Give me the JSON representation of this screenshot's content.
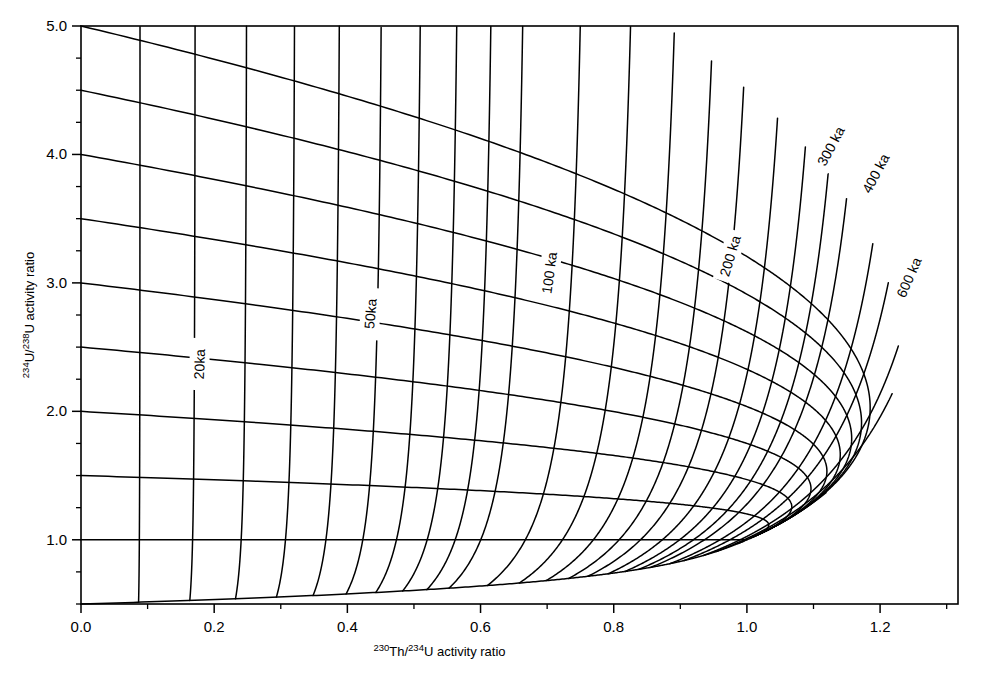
{
  "figure": {
    "name": "u-series-evolution-diagram",
    "background_color": "#ffffff",
    "line_color": "#000000"
  },
  "axes": {
    "x": {
      "label_prefix_sup": "230",
      "label_mid": "Th/",
      "label_prefix_sup2": "234",
      "label_suffix": "U activity  ratio",
      "label_plain": "230Th/234U activity ratio",
      "min": 0.0,
      "max": 1.317,
      "major_ticks": [
        0.0,
        0.2,
        0.4,
        0.6,
        0.8,
        1.0,
        1.2
      ],
      "major_tick_labels": [
        "0.0",
        "0.2",
        "0.4",
        "0.6",
        "0.8",
        "1.0",
        "1.2"
      ],
      "minor_tick_step": 0.1
    },
    "y": {
      "label_prefix_sup": "234",
      "label_mid": "U/",
      "label_prefix_sup2": "238",
      "label_suffix": "U activity ratio",
      "label_plain": "234U/238U activity ratio",
      "min": 0.5,
      "max": 5.0,
      "major_ticks": [
        1.0,
        2.0,
        3.0,
        4.0,
        5.0
      ],
      "major_tick_labels": [
        "1.0",
        "2.0",
        "3.0",
        "4.0",
        "5.0"
      ],
      "minor_tick_step": 0.25
    }
  },
  "chart_data": {
    "type": "line",
    "title": "",
    "xlabel": "230Th/234U activity ratio",
    "ylabel": "234U/238U activity ratio",
    "xlim": [
      0.0,
      1.317
    ],
    "ylim": [
      0.5,
      5.0
    ],
    "grid": false,
    "legend": "none",
    "constants": {
      "lambda230_per_ka": 0.0091705,
      "lambda234_per_ka": 0.0028263
    },
    "isochrons": {
      "name": "constant-age isochrons",
      "unit": "ka",
      "ages_ka": [
        10,
        20,
        30,
        40,
        50,
        60,
        70,
        80,
        90,
        100,
        120,
        140,
        160,
        180,
        200,
        225,
        250,
        275,
        300,
        350,
        400,
        500,
        600,
        1000
      ],
      "labeled_ages": [
        {
          "age_ka": 20,
          "text": "20ka",
          "x_frac": 0.135,
          "y_frac": 0.585,
          "rotate": -88
        },
        {
          "age_ka": 50,
          "text": "50ka",
          "x_frac": 0.33,
          "y_frac": 0.498,
          "rotate": -85
        },
        {
          "age_ka": 100,
          "text": "100 ka",
          "x_frac": 0.534,
          "y_frac": 0.427,
          "rotate": -82
        },
        {
          "age_ka": 200,
          "text": "200 ka",
          "x_frac": 0.74,
          "y_frac": 0.398,
          "rotate": -73
        },
        {
          "age_ka": 300,
          "text": "300 ka",
          "x_frac": 0.855,
          "y_frac": 0.208,
          "rotate": -62
        },
        {
          "age_ka": 400,
          "text": "400 ka",
          "x_frac": 0.906,
          "y_frac": 0.255,
          "rotate": -62
        },
        {
          "age_ka": 600,
          "text": "600 ka",
          "x_frac": 0.944,
          "y_frac": 0.435,
          "rotate": -66
        }
      ]
    },
    "evolution_curves": {
      "name": "constant initial 234U/238U evolution paths",
      "initial_ratios": [
        5.0,
        4.5,
        4.0,
        3.5,
        3.0,
        2.5,
        2.0,
        1.5,
        1.0,
        0.5
      ],
      "labels": [
        "5.0",
        "4.5",
        "4.0",
        "3.5",
        "3.0",
        "2.5",
        "2.0",
        "1.5",
        "1.0",
        "0.5"
      ],
      "note": "Each path starts on the y-axis at its initial 234U/238U value (x=0) and evolves toward secular equilibrium (1,1)."
    }
  },
  "labels": {
    "age_unit": "ka"
  }
}
